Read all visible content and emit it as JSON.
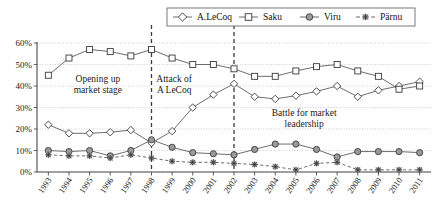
{
  "chart_data": {
    "type": "line",
    "title": "",
    "xlabel": "",
    "ylabel": "",
    "ylim": [
      0,
      60
    ],
    "ytick_labels": [
      "0%",
      "10%",
      "20%",
      "30%",
      "40%",
      "50%",
      "60%"
    ],
    "ytick_values": [
      0,
      10,
      20,
      30,
      40,
      50,
      60
    ],
    "grid": true,
    "legend_position": "top-center",
    "categories": [
      "1993",
      "1994",
      "1995",
      "1996",
      "1997",
      "1998",
      "1999",
      "2000",
      "2001",
      "2002",
      "2003",
      "2004",
      "2005",
      "2006",
      "2007",
      "2008",
      "2009",
      "2010",
      "2011"
    ],
    "series": [
      {
        "name": "A.LeCoq",
        "marker": "open-diamond",
        "line_style": "solid",
        "color": "#5c5c5c",
        "values": [
          22,
          18,
          18,
          18.5,
          19.5,
          13.5,
          19,
          30,
          36,
          41,
          35,
          34,
          35.5,
          37.5,
          40,
          35,
          38,
          40,
          42
        ]
      },
      {
        "name": "Saku",
        "marker": "open-square",
        "line_style": "solid",
        "color": "#5c5c5c",
        "values": [
          45,
          53,
          57,
          56,
          54,
          57,
          53,
          50,
          50,
          48,
          44.5,
          44.5,
          47,
          49,
          50,
          47,
          44.5,
          38.5,
          40
        ]
      },
      {
        "name": "Viru",
        "marker": "filled-circle",
        "line_style": "solid",
        "color": "#5c5c5c",
        "values": [
          10,
          9.5,
          10,
          7.5,
          10,
          15,
          11.5,
          9,
          8.5,
          8,
          10.5,
          13,
          13,
          10.5,
          7,
          9.5,
          9.5,
          9.5,
          9
        ]
      },
      {
        "name": "Pärnu",
        "marker": "star",
        "line_style": "dashed",
        "color": "#5c5c5c",
        "values": [
          8,
          7.5,
          7.5,
          6.5,
          8,
          6.5,
          5,
          4.5,
          4.5,
          4,
          3.5,
          2.5,
          1,
          4,
          4.5,
          1,
          1,
          1,
          1
        ]
      }
    ],
    "annotations": [
      {
        "id": "opening-up",
        "lines": [
          "Opening up",
          "market stage"
        ],
        "x": 1995.4,
        "y": 42
      },
      {
        "id": "attack-alecoq",
        "lines": [
          "Attack of",
          "A LeCoq"
        ],
        "x": 1999.1,
        "y": 42
      },
      {
        "id": "battle-leadership",
        "lines": [
          "Battle for market",
          "leadership"
        ],
        "x": 2005.4,
        "y": 26
      }
    ],
    "event_lines": [
      {
        "id": "event-1998",
        "x": 1998
      },
      {
        "id": "event-2002",
        "x": 2002
      }
    ]
  },
  "legend": {
    "items": [
      {
        "label": "A.LeCoq",
        "icon": "open-diamond-marker-icon"
      },
      {
        "label": "Saku",
        "icon": "open-square-marker-icon"
      },
      {
        "label": "Viru",
        "icon": "filled-circle-marker-icon"
      },
      {
        "label": "Pärnu",
        "icon": "star-marker-icon"
      }
    ]
  }
}
